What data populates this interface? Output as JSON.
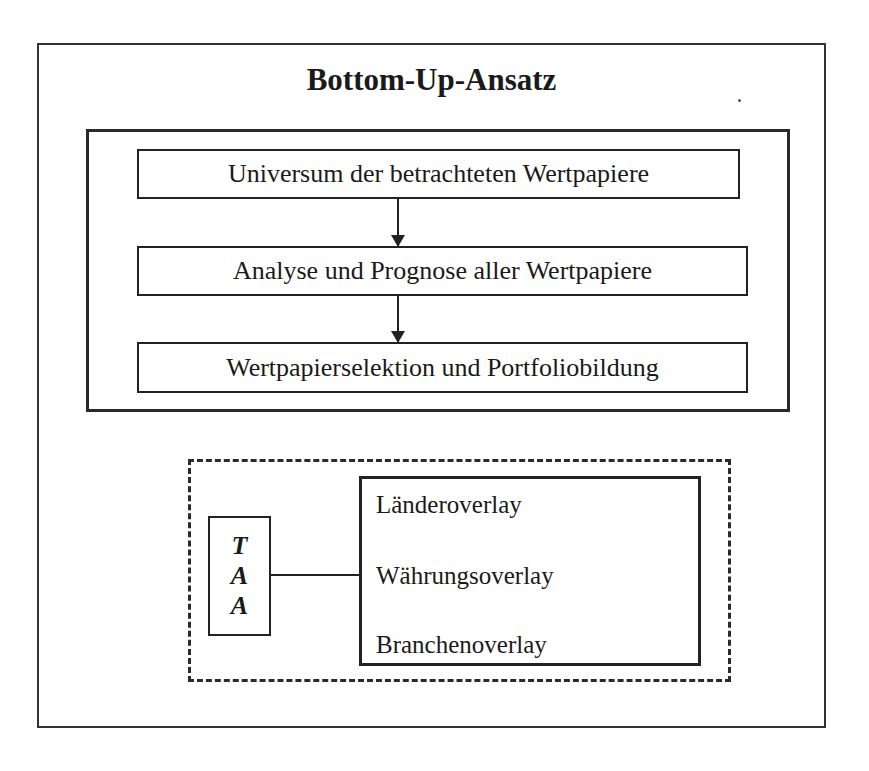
{
  "diagram": {
    "title": "Bottom-Up-Ansatz",
    "process": {
      "steps": [
        {
          "label": "Universum der betrachteten Wertpapiere"
        },
        {
          "label": "Analyse und Prognose aller Wertpapiere"
        },
        {
          "label": "Wertpapierselektion und Portfoliobildung"
        }
      ],
      "arrows": [
        {
          "from": 0,
          "to": 1
        },
        {
          "from": 1,
          "to": 2
        }
      ]
    },
    "overlay_section": {
      "style": "dashed",
      "taa": {
        "letters": [
          "T",
          "A",
          "A"
        ]
      },
      "overlays": [
        {
          "label": "Länderoverlay"
        },
        {
          "label": "Währungsoverlay"
        },
        {
          "label": "Branchenoverlay"
        }
      ]
    },
    "colors": {
      "line": "#222222",
      "background": "#ffffff",
      "text": "#1a1a1a"
    }
  }
}
